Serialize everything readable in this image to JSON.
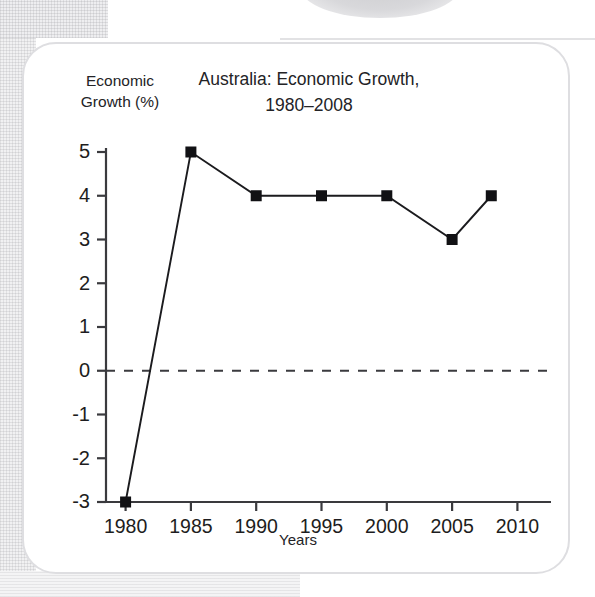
{
  "chart_data": {
    "type": "line",
    "title": "Australia: Economic Growth,\n1980–2008",
    "title_line1": "Australia: Economic Growth,",
    "title_line2": "1980–2008",
    "ylabel": "Economic\nGrowth (%)",
    "ylabel_line1": "Economic",
    "ylabel_line2": "Growth (%)",
    "xlabel": "Years",
    "x": [
      1980,
      1985,
      1990,
      1995,
      2000,
      2005,
      2008
    ],
    "values": [
      -3,
      5,
      4,
      4,
      4,
      3,
      4
    ],
    "points": [
      {
        "year": 1980,
        "value": -3
      },
      {
        "year": 1985,
        "value": 5
      },
      {
        "year": 1990,
        "value": 4
      },
      {
        "year": 1995,
        "value": 4
      },
      {
        "year": 2000,
        "value": 4
      },
      {
        "year": 2005,
        "value": 3
      },
      {
        "year": 2008,
        "value": 4
      }
    ],
    "xlim": [
      1978.5,
      2011.5
    ],
    "ylim": [
      -3,
      5
    ],
    "xticks": [
      1980,
      1985,
      1990,
      1995,
      2000,
      2005,
      2010
    ],
    "xtick_labels": [
      "1980",
      "1985",
      "1990",
      "1995",
      "2000",
      "2005",
      "2010"
    ],
    "yticks": [
      5,
      4,
      3,
      2,
      1,
      0,
      -1,
      -2,
      -3
    ],
    "ytick_labels": [
      "5",
      "4",
      "3",
      "2",
      "1",
      "0",
      "-1",
      "-2",
      "-3"
    ],
    "zero_line": {
      "value": 0,
      "style": "dashed",
      "color": "#3b3b3f"
    },
    "grid": false,
    "legend": null,
    "marker": "filled-square",
    "marker_color": "#111114",
    "line_color": "#1b1b1e",
    "axis_color": "#3a3a3e"
  },
  "colors": {
    "card_background": "#ffffff",
    "card_border": "#dedee1",
    "page_background": "#ffffff",
    "texture": "#f1f1f2",
    "text": "#232326",
    "series": "#1b1b1e"
  }
}
